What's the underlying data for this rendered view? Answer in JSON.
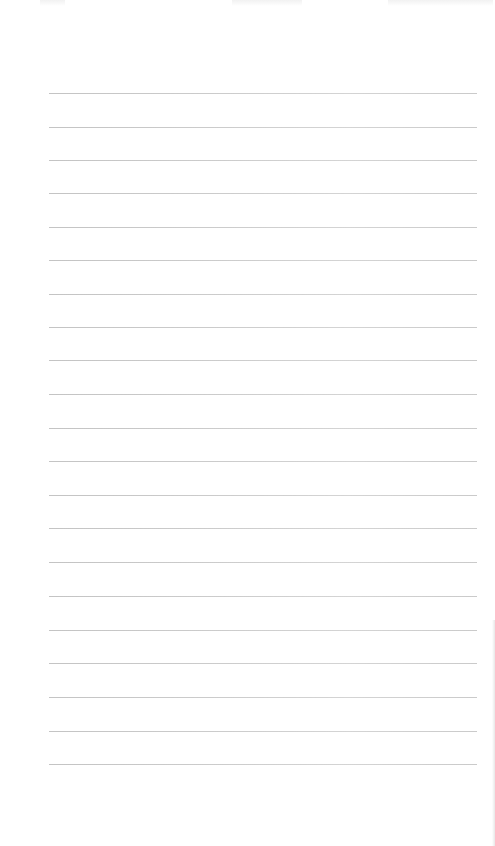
{
  "page": {
    "type": "lined-paper",
    "background_color": "#ffffff",
    "rule_color": "#c4c4c4",
    "rule_count": 21,
    "rules": [
      {
        "index": 1,
        "y": 93
      },
      {
        "index": 2,
        "y": 127
      },
      {
        "index": 3,
        "y": 160
      },
      {
        "index": 4,
        "y": 193
      },
      {
        "index": 5,
        "y": 227
      },
      {
        "index": 6,
        "y": 260
      },
      {
        "index": 7,
        "y": 294
      },
      {
        "index": 8,
        "y": 327
      },
      {
        "index": 9,
        "y": 360
      },
      {
        "index": 10,
        "y": 394
      },
      {
        "index": 11,
        "y": 428
      },
      {
        "index": 12,
        "y": 461
      },
      {
        "index": 13,
        "y": 495
      },
      {
        "index": 14,
        "y": 528
      },
      {
        "index": 15,
        "y": 562
      },
      {
        "index": 16,
        "y": 596
      },
      {
        "index": 17,
        "y": 630
      },
      {
        "index": 18,
        "y": 663
      },
      {
        "index": 19,
        "y": 697
      },
      {
        "index": 20,
        "y": 731
      },
      {
        "index": 21,
        "y": 764
      }
    ]
  }
}
